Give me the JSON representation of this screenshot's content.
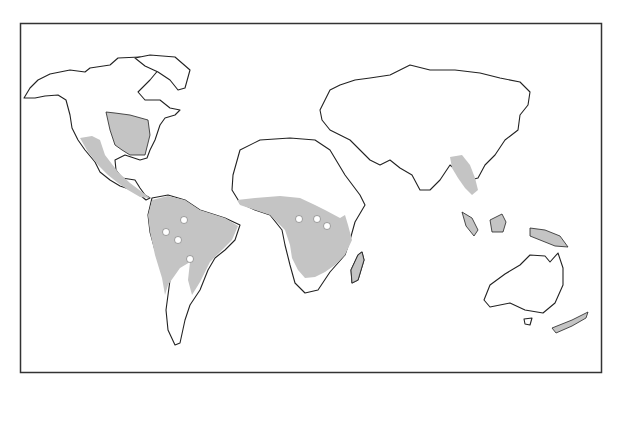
{
  "map": {
    "type": "world-outline-map",
    "projection": "equirectangular-style",
    "colors": {
      "background": "#ffffff",
      "frame": "#333333",
      "land_outline": "#222222",
      "shaded_region": "#c4c4c4",
      "marker_fill": "#ffffff"
    },
    "shaded_regions": [
      "Eastern North America",
      "Western Mexico and Central America",
      "Northern and central South America",
      "Central and eastern Africa",
      "Southeast Asia (Indochina)",
      "Borneo",
      "Sumatra",
      "New Guinea",
      "Madagascar",
      "New Zealand"
    ],
    "markers": [
      {
        "region": "South America",
        "x": 184,
        "y": 220
      },
      {
        "region": "South America",
        "x": 178,
        "y": 240
      },
      {
        "region": "South America",
        "x": 190,
        "y": 259
      },
      {
        "region": "South America",
        "x": 166,
        "y": 232
      },
      {
        "region": "Africa",
        "x": 299,
        "y": 219
      },
      {
        "region": "Africa",
        "x": 317,
        "y": 219
      },
      {
        "region": "Africa",
        "x": 327,
        "y": 226
      }
    ]
  }
}
